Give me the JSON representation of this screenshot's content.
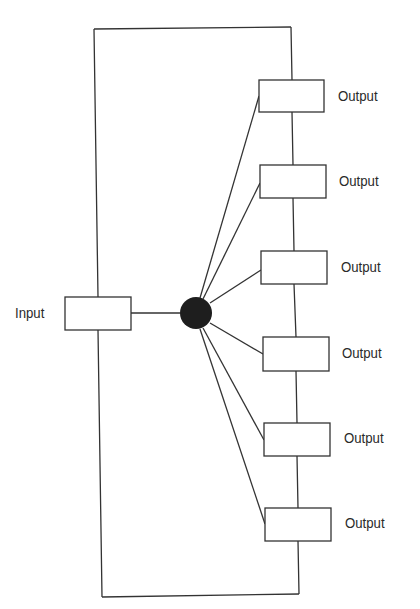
{
  "diagram": {
    "type": "block-diagram",
    "input": {
      "label": "Input",
      "box": {
        "x": 65,
        "y": 297,
        "w": 66,
        "h": 33
      }
    },
    "hub": {
      "cx": 196,
      "cy": 313,
      "r": 16,
      "color": "#1e1e1e"
    },
    "frame": {
      "x1": 94,
      "y1": 28,
      "x2": 296,
      "y2": 596
    },
    "outputs": [
      {
        "label": "Output",
        "box": {
          "x": 259,
          "y": 80,
          "w": 65,
          "h": 32
        }
      },
      {
        "label": "Output",
        "box": {
          "x": 260,
          "y": 165,
          "w": 66,
          "h": 33
        }
      },
      {
        "label": "Output",
        "box": {
          "x": 261,
          "y": 251,
          "w": 66,
          "h": 33
        }
      },
      {
        "label": "Output",
        "box": {
          "x": 263,
          "y": 337,
          "w": 66,
          "h": 34
        }
      },
      {
        "label": "Output",
        "box": {
          "x": 264,
          "y": 423,
          "w": 66,
          "h": 33
        }
      },
      {
        "label": "Output",
        "box": {
          "x": 265,
          "y": 508,
          "w": 66,
          "h": 33
        }
      }
    ],
    "stroke_color": "#333333"
  }
}
